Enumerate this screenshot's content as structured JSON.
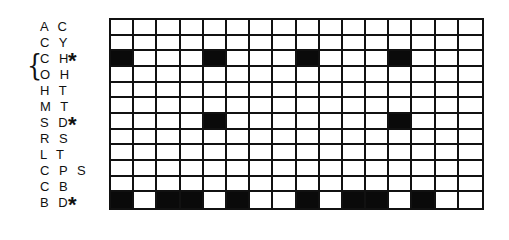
{
  "rows": [
    {
      "label": "A C",
      "marked": false,
      "filled": []
    },
    {
      "label": "C Y",
      "marked": false,
      "filled": []
    },
    {
      "label": "C H",
      "marked": true,
      "filled": [
        0,
        4,
        8,
        12
      ]
    },
    {
      "label": "O H",
      "marked": false,
      "filled": []
    },
    {
      "label": "H T",
      "marked": false,
      "filled": []
    },
    {
      "label": "M T",
      "marked": false,
      "filled": []
    },
    {
      "label": "S D",
      "marked": true,
      "filled": [
        4,
        12
      ]
    },
    {
      "label": "R S",
      "marked": false,
      "filled": []
    },
    {
      "label": "L T",
      "marked": false,
      "filled": []
    },
    {
      "label": "C P S",
      "marked": false,
      "filled": []
    },
    {
      "label": "C B",
      "marked": false,
      "filled": []
    },
    {
      "label": "B D",
      "marked": true,
      "filled": [
        0,
        2,
        3,
        5,
        8,
        10,
        11,
        13
      ]
    }
  ],
  "columns": 16,
  "marker_symbol": "*",
  "brace_symbol": "{",
  "brace_rows": [
    2,
    3
  ],
  "colors": {
    "filled": "#0a0a0a",
    "empty": "#ffffff",
    "line": "#111111"
  }
}
